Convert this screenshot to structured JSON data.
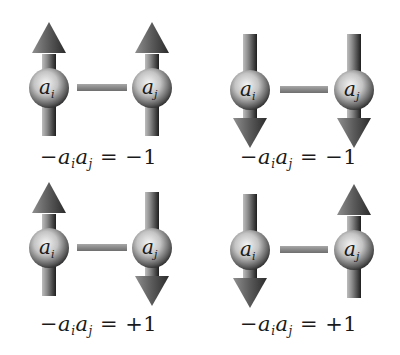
{
  "diagram": {
    "title": "",
    "colors": {
      "background": "#ffffff",
      "sphere_highlight": "#f2f2f2",
      "sphere_edge": "#2e2e2e",
      "arrow_light": "#9a9a9a",
      "arrow_dark": "#2a2a2a",
      "bond": "#8a8a8a",
      "text": "#1a1a1a"
    },
    "panels": [
      {
        "id": "top-left",
        "spin_i": "up",
        "spin_j": "up",
        "site_i_label": "a",
        "site_i_sub": "i",
        "site_j_label": "a",
        "site_j_sub": "j",
        "equation": {
          "minus": "−",
          "var1": "a",
          "sub1": "i",
          "var2": "a",
          "sub2": "j",
          "equals": "=",
          "value": "−1"
        }
      },
      {
        "id": "top-right",
        "spin_i": "down",
        "spin_j": "down",
        "site_i_label": "a",
        "site_i_sub": "i",
        "site_j_label": "a",
        "site_j_sub": "j",
        "equation": {
          "minus": "−",
          "var1": "a",
          "sub1": "i",
          "var2": "a",
          "sub2": "j",
          "equals": "=",
          "value": "−1"
        }
      },
      {
        "id": "bottom-left",
        "spin_i": "up",
        "spin_j": "down",
        "site_i_label": "a",
        "site_i_sub": "i",
        "site_j_label": "a",
        "site_j_sub": "j",
        "equation": {
          "minus": "−",
          "var1": "a",
          "sub1": "i",
          "var2": "a",
          "sub2": "j",
          "equals": "=",
          "value": "+1"
        }
      },
      {
        "id": "bottom-right",
        "spin_i": "down",
        "spin_j": "up",
        "site_i_label": "a",
        "site_i_sub": "i",
        "site_j_label": "a",
        "site_j_sub": "j",
        "equation": {
          "minus": "−",
          "var1": "a",
          "sub1": "i",
          "var2": "a",
          "sub2": "j",
          "equals": "=",
          "value": "+1"
        }
      }
    ]
  }
}
